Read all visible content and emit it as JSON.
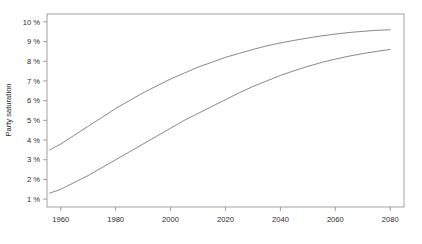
{
  "chart_data": {
    "type": "line",
    "title": "",
    "subtitle": "",
    "xlabel": "",
    "ylabel": "Party saturation",
    "xlim": [
      1955,
      2085
    ],
    "ylim": [
      0.6,
      10.4
    ],
    "grid": false,
    "legend": "none",
    "axis_frame": "box",
    "xticks": [
      1960,
      1980,
      2000,
      2020,
      2040,
      2060,
      2080
    ],
    "xtick_labels": [
      "1960",
      "1980",
      "2000",
      "2020",
      "2040",
      "2060",
      "2080"
    ],
    "yticks": [
      1,
      2,
      3,
      4,
      5,
      6,
      7,
      8,
      9,
      10
    ],
    "ytick_labels": [
      "1 %",
      "2 %",
      "3 %",
      "4 %",
      "5 %",
      "6 %",
      "7 %",
      "8 %",
      "9 %",
      "10 %"
    ],
    "line_color": "#555555",
    "line_width": 0.7,
    "x": [
      1956,
      1960,
      1965,
      1970,
      1975,
      1980,
      1985,
      1990,
      1995,
      2000,
      2005,
      2010,
      2015,
      2020,
      2025,
      2030,
      2035,
      2040,
      2045,
      2050,
      2055,
      2060,
      2065,
      2070,
      2075,
      2080
    ],
    "series": [
      {
        "name": "upper-curve",
        "values": [
          3.5,
          3.8,
          4.25,
          4.7,
          5.15,
          5.6,
          6.0,
          6.4,
          6.75,
          7.1,
          7.4,
          7.7,
          7.95,
          8.2,
          8.4,
          8.6,
          8.78,
          8.93,
          9.06,
          9.18,
          9.29,
          9.38,
          9.46,
          9.52,
          9.57,
          9.6
        ]
      },
      {
        "name": "lower-curve",
        "values": [
          1.3,
          1.5,
          1.85,
          2.2,
          2.6,
          3.0,
          3.4,
          3.8,
          4.2,
          4.6,
          5.0,
          5.35,
          5.7,
          6.05,
          6.4,
          6.72,
          7.0,
          7.28,
          7.52,
          7.74,
          7.94,
          8.11,
          8.26,
          8.39,
          8.5,
          8.6
        ]
      }
    ]
  }
}
